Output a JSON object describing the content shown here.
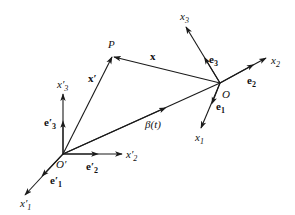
{
  "diagram": {
    "type": "coordinate-frames",
    "points": {
      "O_prime": {
        "label": "O′",
        "x": 63,
        "y": 154
      },
      "O": {
        "label": "O",
        "x": 220,
        "y": 83
      },
      "P": {
        "label": "P",
        "x": 113,
        "y": 56
      }
    },
    "labels": {
      "P": "P",
      "O": "O",
      "O_prime": "O′",
      "x_vec": "x",
      "x_prime_vec": "x′",
      "beta": "β(t)",
      "x1": "x",
      "x1_sub": "1",
      "x2": "x",
      "x2_sub": "2",
      "x3": "x",
      "x3_sub": "3",
      "e1": "e",
      "e1_sub": "1",
      "e2": "e",
      "e2_sub": "2",
      "e3": "e",
      "e3_sub": "3",
      "x1p": "x′",
      "x1p_sub": "1",
      "x2p": "x′",
      "x2p_sub": "2",
      "x3p": "x′",
      "x3p_sub": "3",
      "e1p": "e′",
      "e1p_sub": "1",
      "e2p": "e′",
      "e2p_sub": "2",
      "e3p": "e′",
      "e3p_sub": "3"
    },
    "vectors": [
      {
        "name": "x-prime",
        "from": "O′",
        "to": "P"
      },
      {
        "name": "x",
        "from": "O",
        "to": "P"
      },
      {
        "name": "beta(t)",
        "from": "O′",
        "to": "O"
      }
    ],
    "axes_moving_frame": [
      "x1",
      "x2",
      "x3"
    ],
    "axes_fixed_frame": [
      "x1′",
      "x2′",
      "x3′"
    ],
    "colors": {
      "ink": "#1a1a1a",
      "background": "#ffffff"
    }
  }
}
